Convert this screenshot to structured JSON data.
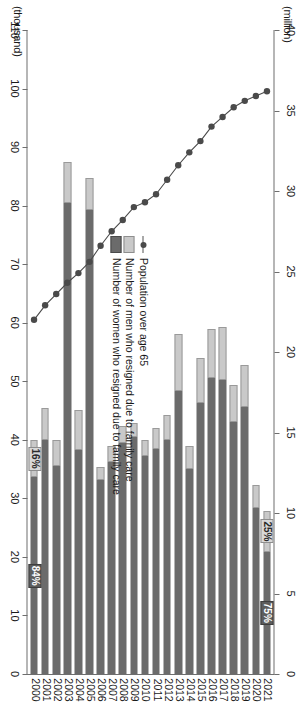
{
  "chart_data": {
    "type": "bar",
    "title": "",
    "subtitle": "",
    "orientation": "horizontal-rotated-90",
    "categories": [
      "2000",
      "2001",
      "2002",
      "2003",
      "2004",
      "2005",
      "2006",
      "2007",
      "2008",
      "2009",
      "2010",
      "2011",
      "2012",
      "2013",
      "2014",
      "2015",
      "2016",
      "2017",
      "2018",
      "2019",
      "2020",
      "2021"
    ],
    "xlabel": "",
    "axes": [
      {
        "name": "population-axis",
        "caption": "(million)",
        "position": "top",
        "ticks": [
          40,
          35,
          30,
          25,
          20,
          15,
          10,
          5,
          0
        ],
        "range": [
          0,
          40
        ],
        "direction": "right-to-left"
      },
      {
        "name": "resignations-axis",
        "caption": "(thousand)",
        "position": "bottom",
        "ticks": [
          110,
          100,
          90,
          80,
          70,
          60,
          50,
          40,
          30,
          20,
          10,
          0
        ],
        "range": [
          0,
          110
        ],
        "direction": "right-to-left"
      }
    ],
    "grid": false,
    "legend_position": "inside-left",
    "series": [
      {
        "name": "Population over age 65",
        "key": "population",
        "type": "line",
        "unit": "million",
        "axis": "population-axis",
        "color": "#4a4a4a",
        "values": [
          22.0,
          22.9,
          23.6,
          24.3,
          24.9,
          25.6,
          26.6,
          27.5,
          28.2,
          29.0,
          29.3,
          29.8,
          30.7,
          31.6,
          32.4,
          33.1,
          34.0,
          34.6,
          35.2,
          35.6,
          35.9,
          36.2
        ]
      },
      {
        "name": "Number of men who resigned due to family care",
        "key": "men",
        "type": "bar-segment",
        "unit": "thousand",
        "axis": "resignations-axis",
        "color": "#c9c9c9",
        "values": [
          6.4,
          5.6,
          4.5,
          7.0,
          6.8,
          5.6,
          2.2,
          2.8,
          3.0,
          2.4,
          2.7,
          3.6,
          4.3,
          9.7,
          3.9,
          7.7,
          8.4,
          9.0,
          6.4,
          7.1,
          4.0,
          6.9
        ]
      },
      {
        "name": "Number of women who resigned due to family care",
        "key": "women",
        "type": "bar-segment",
        "unit": "thousand",
        "axis": "resignations-axis",
        "color": "#6b6b6b",
        "values": [
          33.6,
          39.9,
          35.5,
          80.5,
          38.3,
          79.2,
          33.1,
          36.2,
          39.4,
          40.5,
          37.3,
          38.5,
          40.0,
          48.3,
          35.0,
          46.3,
          50.6,
          50.3,
          43.0,
          45.6,
          28.3,
          20.9
        ]
      }
    ],
    "annotations": [
      {
        "name": "men-share-2000",
        "text": "16%",
        "category": "2000",
        "series": "men",
        "style": "light"
      },
      {
        "name": "women-share-2000",
        "text": "84%",
        "category": "2000",
        "series": "women",
        "style": "dark"
      },
      {
        "name": "men-share-2021",
        "text": "25%",
        "category": "2021",
        "series": "men",
        "style": "light"
      },
      {
        "name": "women-share-2021",
        "text": "75%",
        "category": "2021",
        "series": "women",
        "style": "dark"
      }
    ]
  },
  "legend": {
    "items": [
      {
        "label": "Population over age 65",
        "marker": "line-marker"
      },
      {
        "label": "Number of men who resigned due to family care",
        "marker": "men-swatch"
      },
      {
        "label": "Number of women who resigned due to family care",
        "marker": "women-swatch"
      }
    ]
  },
  "colors": {
    "men": "#c9c9c9",
    "women": "#6b6b6b",
    "line": "#4a4a4a",
    "axis": "#6e6e6e",
    "background": "#ffffff"
  }
}
